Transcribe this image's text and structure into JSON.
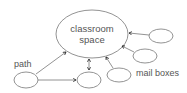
{
  "diagram": {
    "title": "",
    "nodes": [
      {
        "id": "classroom",
        "label_lines": [
          "classroom",
          "space"
        ]
      },
      {
        "id": "path-node",
        "label": ""
      },
      {
        "id": "bottom-node",
        "label": ""
      },
      {
        "id": "mailbox-1",
        "label": ""
      },
      {
        "id": "mailbox-2",
        "label": ""
      },
      {
        "id": "mailbox-3",
        "label": ""
      }
    ],
    "labels": {
      "path": "path",
      "mail_boxes": "mail boxes",
      "classroom_line1": "classroom",
      "classroom_line2": "space"
    },
    "edges": [
      {
        "from": "path-node",
        "to": "classroom",
        "type": "arrow"
      },
      {
        "from": "path-node",
        "to": "bottom-node",
        "type": "arrow"
      },
      {
        "from": "bottom-node",
        "to": "classroom",
        "type": "double-arrow"
      },
      {
        "from": "mailbox-1",
        "to": "classroom",
        "type": "arrow"
      },
      {
        "from": "mailbox-2",
        "to": "classroom",
        "type": "arrow"
      },
      {
        "from": "mailbox-3",
        "to": "classroom",
        "type": "arrow"
      }
    ],
    "colors": {
      "stroke": "#777777",
      "arrowhead": "#222222",
      "text": "#555555"
    }
  }
}
